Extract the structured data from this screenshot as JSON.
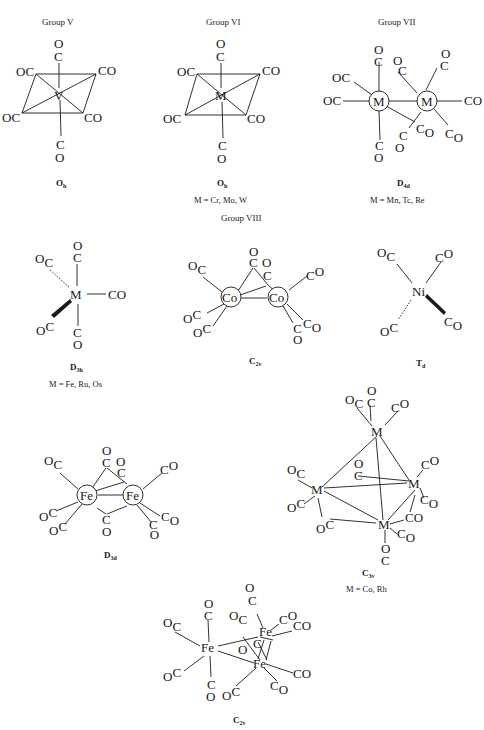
{
  "figure": {
    "structures": [
      {
        "id": "v-co6",
        "group_label": "Group V",
        "metal": "V",
        "ligands": [
          "CO",
          "CO",
          "CO",
          "CO",
          "CO",
          "CO"
        ],
        "ligand_labels": {
          "top_o": "O",
          "top_c": "C",
          "ul": "OC",
          "ur": "CO",
          "ll": "OC",
          "lr": "CO",
          "bot_c": "C",
          "bot_o": "O"
        },
        "point_group": "O",
        "point_group_sub": "h"
      },
      {
        "id": "m-co6",
        "group_label": "Group VI",
        "metal": "M",
        "ligand_labels": {
          "top_o": "O",
          "top_c": "C",
          "ul": "OC",
          "ur": "CO",
          "ll": "OC",
          "lr": "CO",
          "bot_c": "C",
          "bot_o": "O"
        },
        "point_group": "O",
        "point_group_sub": "h",
        "metals_list": "M = Cr, Mo, W"
      },
      {
        "id": "m2-co10",
        "group_label": "Group VII",
        "metal": "M",
        "point_group": "D",
        "point_group_sub": "4d",
        "metals_list": "M = Mn, Tc, Re"
      },
      {
        "id": "m-co5",
        "group_label": "Group VIII",
        "metal": "M",
        "point_group": "D",
        "point_group_sub": "3h",
        "metals_list": "M = Fe, Ru, Os"
      },
      {
        "id": "co2-co8",
        "metal": "Co",
        "point_group": "C",
        "point_group_sub": "2v"
      },
      {
        "id": "ni-co4",
        "metal": "Ni",
        "point_group": "T",
        "point_group_sub": "d"
      },
      {
        "id": "fe2-co9",
        "metal": "Fe",
        "point_group": "D",
        "point_group_sub": "3d"
      },
      {
        "id": "m4-co12",
        "metal": "M",
        "point_group": "C",
        "point_group_sub": "3v",
        "metals_list": "M = Co, Rh"
      },
      {
        "id": "fe3-co12",
        "metal": "Fe",
        "point_group": "C",
        "point_group_sub": "2v"
      }
    ],
    "text": {
      "O": "O",
      "C": "C",
      "OC": "OC",
      "CO": "CO"
    }
  }
}
